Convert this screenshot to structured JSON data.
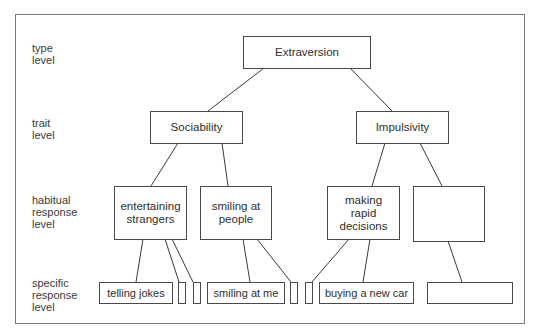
{
  "diagram": {
    "levels": [
      {
        "id": "type",
        "label_line1": "type",
        "label_line2": "level"
      },
      {
        "id": "trait",
        "label_line1": "trait",
        "label_line2": "level"
      },
      {
        "id": "habitual",
        "label_line1": "habitual",
        "label_line2": "response",
        "label_line3": "level"
      },
      {
        "id": "specific",
        "label_line1": "specific",
        "label_line2": "response",
        "label_line3": "level"
      }
    ],
    "nodes": {
      "type": {
        "label": "Extraversion"
      },
      "traits": [
        {
          "label": "Sociability"
        },
        {
          "label": "Impulsivity"
        }
      ],
      "habitual": [
        {
          "line1": "entertaining",
          "line2": "strangers",
          "parent": "Sociability"
        },
        {
          "line1": "smiling at",
          "line2": "people",
          "parent": "Sociability"
        },
        {
          "line1": "making",
          "line2": "rapid",
          "line3": "decisions",
          "parent": "Impulsivity"
        },
        {
          "line1": "",
          "parent": "Impulsivity"
        }
      ],
      "specific": [
        {
          "label": "telling jokes",
          "parent": "entertaining strangers"
        },
        {
          "label": "",
          "parent": "entertaining strangers"
        },
        {
          "label": "",
          "parent": "entertaining strangers"
        },
        {
          "label": "smiling at me",
          "parent": "smiling at people"
        },
        {
          "label": "",
          "parent": "smiling at people"
        },
        {
          "label": "",
          "parent": "making rapid decisions"
        },
        {
          "label": "buying a new car",
          "parent": "making rapid decisions"
        },
        {
          "label": "",
          "parent": "(empty habitual)"
        }
      ]
    },
    "colors": {
      "stroke": "#3a3a3a",
      "frame": "#7a7a7a",
      "text": "#2e2e2e"
    }
  }
}
